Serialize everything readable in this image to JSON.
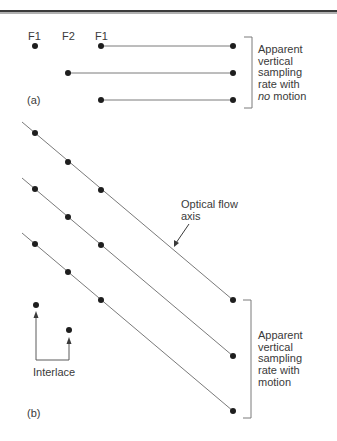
{
  "header_rule": true,
  "part_a": {
    "label": "(a)",
    "field_labels": [
      "F1",
      "F2",
      "F1"
    ],
    "caption_lines": [
      "Apparent",
      "vertical",
      "sampling",
      "rate with"
    ],
    "caption_last_emphasis": "no",
    "caption_last_rest": " motion"
  },
  "part_b": {
    "label": "(b)",
    "flow_label_line1": "Optical flow",
    "flow_label_line2": "axis",
    "interlace_label": "Interlace",
    "caption_lines": [
      "Apparent",
      "vertical",
      "sampling",
      "rate with",
      "motion"
    ]
  },
  "colors": {
    "line": "#7a7a7a",
    "dot": "#1e1e1e",
    "text": "#3a3a3a"
  }
}
